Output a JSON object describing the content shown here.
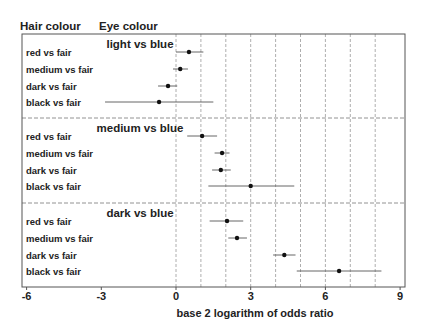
{
  "chart_data": {
    "type": "scatter",
    "subtype": "forest-plot",
    "title": "",
    "header_left": "Hair colour",
    "header_right": "Eye colour",
    "xlabel": "base 2 logarithm of odds ratio",
    "ylabel": "",
    "xlim": [
      -6,
      9
    ],
    "x_ticks": [
      -6,
      -3,
      0,
      3,
      6,
      9
    ],
    "x_tick_labels": [
      "-6",
      "-3",
      "0",
      "3",
      "6",
      "9"
    ],
    "vertical_gridlines": [
      0,
      1,
      2,
      3,
      4,
      5,
      6,
      7,
      8
    ],
    "grid": true,
    "groups": [
      {
        "name": "light vs blue",
        "rows": [
          {
            "label": "red vs fair",
            "estimate": 0.52,
            "lower": 0.0,
            "upper": 1.1
          },
          {
            "label": "medium vs fair",
            "estimate": 0.17,
            "lower": -0.12,
            "upper": 0.48
          },
          {
            "label": "dark vs fair",
            "estimate": -0.32,
            "lower": -0.72,
            "upper": 0.05
          },
          {
            "label": "black vs fair",
            "estimate": -0.68,
            "lower": -2.85,
            "upper": 1.5
          }
        ]
      },
      {
        "name": "medium vs blue",
        "rows": [
          {
            "label": "red vs fair",
            "estimate": 1.05,
            "lower": 0.45,
            "upper": 1.65
          },
          {
            "label": "medium vs fair",
            "estimate": 1.85,
            "lower": 1.55,
            "upper": 2.15
          },
          {
            "label": "dark vs fair",
            "estimate": 1.8,
            "lower": 1.45,
            "upper": 2.2
          },
          {
            "label": "black vs fair",
            "estimate": 3.0,
            "lower": 1.3,
            "upper": 4.75
          }
        ]
      },
      {
        "name": "dark vs blue",
        "rows": [
          {
            "label": "red vs fair",
            "estimate": 2.05,
            "lower": 1.35,
            "upper": 2.7
          },
          {
            "label": "medium vs fair",
            "estimate": 2.45,
            "lower": 2.1,
            "upper": 2.85
          },
          {
            "label": "dark vs fair",
            "estimate": 4.35,
            "lower": 3.9,
            "upper": 4.8
          },
          {
            "label": "black vs fair",
            "estimate": 6.55,
            "lower": 4.85,
            "upper": 8.25
          }
        ]
      }
    ]
  }
}
